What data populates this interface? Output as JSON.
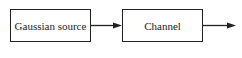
{
  "diagram": {
    "nodes": [
      {
        "id": "gaussian-source",
        "label": "Gaussian source"
      },
      {
        "id": "channel",
        "label": "Channel"
      }
    ],
    "edges": [
      {
        "from": "gaussian-source",
        "to": "channel"
      },
      {
        "from": "channel",
        "to": "output"
      }
    ]
  }
}
